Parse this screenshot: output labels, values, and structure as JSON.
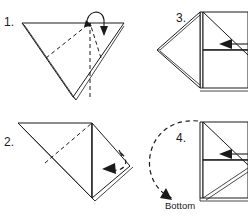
{
  "figure": {
    "kind": "origami-folding-instructions",
    "background_color": "#ffffff",
    "ink_color": "#1a1a1a",
    "panel_count": 4
  },
  "steps": [
    {
      "id": "step-1",
      "number": "1.",
      "shape": "downward-pointing triangle",
      "crease_style": "dashed",
      "arrow": "fold-over-top-point",
      "arrow_icon": "curved-fold-arrow-icon"
    },
    {
      "id": "step-2",
      "number": "2.",
      "shape": "triangle with right flap",
      "crease_style": "dashed",
      "arrow": "fold-right-flap-left",
      "arrow_icon": "curved-fold-arrow-icon"
    },
    {
      "id": "step-3",
      "number": "3.",
      "shape": "kite pointing left",
      "crease_style": "solid",
      "arrow": "fold-inward-left",
      "arrow_icon": "straight-fold-arrow-icon"
    },
    {
      "id": "step-4",
      "number": "4.",
      "shape": "kite pointing left",
      "crease_style": "solid",
      "arrow": "rotate-flip-over",
      "arrow_icon": "curved-rotate-arrow-icon",
      "labels": {
        "top": "To",
        "bottom": "Bottom"
      }
    }
  ]
}
